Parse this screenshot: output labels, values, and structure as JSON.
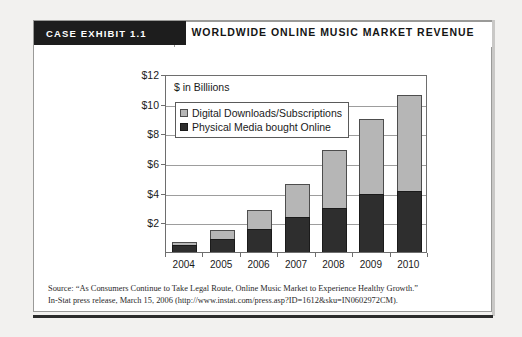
{
  "exhibit": {
    "tab_label": "CASE EXHIBIT 1.1",
    "title": "WORLDWIDE ONLINE MUSIC MARKET REVENUE"
  },
  "source": {
    "line1": "Source: “As Consumers Continue to Take Legal Route, Online Music Market to Experience Healthy Growth.”",
    "line2": "In-Stat press release, March 15, 2006 (http://www.instat.com/press.asp?ID=1612&sku=IN0602972CM)."
  },
  "colors": {
    "digital": "#b6b6b6",
    "physical": "#2e2e2e",
    "tab_background": "#1d1d1d",
    "frame_border": "#9a9a98",
    "gridline": "#9d9d9d"
  },
  "chart_data": {
    "type": "bar",
    "subtype": "stacked-vertical",
    "title": "WORLDWIDE ONLINE MUSIC MARKET REVENUE",
    "units_label": "$ in Billiions",
    "xlabel": "",
    "ylabel": "",
    "categories": [
      "2004",
      "2005",
      "2006",
      "2007",
      "2008",
      "2009",
      "2010"
    ],
    "series": [
      {
        "name": "Physical Media bought Online",
        "color": "#2e2e2e",
        "values": [
          0.5,
          0.85,
          1.55,
          2.35,
          3.0,
          3.9,
          4.1
        ]
      },
      {
        "name": "Digital Downloads/Subscriptions",
        "color": "#b6b6b6",
        "values": [
          0.2,
          0.65,
          1.25,
          2.25,
          3.85,
          5.1,
          6.5
        ]
      }
    ],
    "totals": [
      0.7,
      1.5,
      2.8,
      4.6,
      6.85,
      9.0,
      10.6
    ],
    "ylim": [
      0,
      12
    ],
    "yticks": [
      2,
      4,
      6,
      8,
      10,
      12
    ],
    "ytick_labels": [
      "$2",
      "$4",
      "$6",
      "$8",
      "$10",
      "$12"
    ],
    "grid": true,
    "legend_position": "upper-left-inside",
    "legend_order": [
      "Digital Downloads/Subscriptions",
      "Physical Media bought Online"
    ]
  }
}
